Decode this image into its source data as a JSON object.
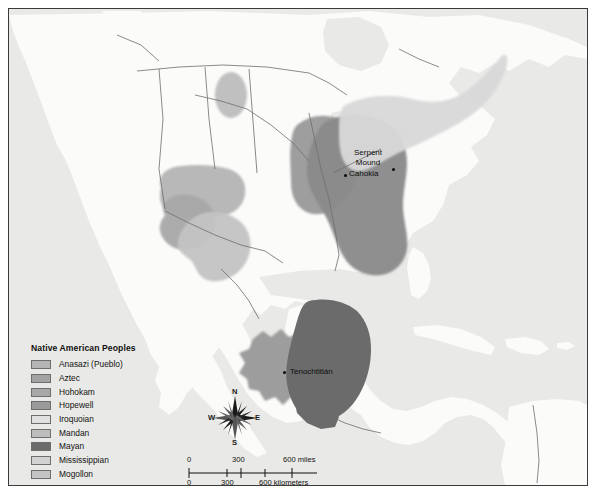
{
  "map": {
    "title": "Native American Peoples",
    "frame_color": "#3a3a3a",
    "ocean_color": "#e9e9e7",
    "land_color": "#fbfbfa",
    "border_color": "#6d6d6d"
  },
  "legend": {
    "title": "Native American Peoples",
    "items": [
      {
        "label": "Anasazi (Pueblo)",
        "color": "#b5b5b5"
      },
      {
        "label": "Aztec",
        "color": "#a3a3a3"
      },
      {
        "label": "Hohokam",
        "color": "#a8a8a8"
      },
      {
        "label": "Hopewell",
        "color": "#9a9a9a"
      },
      {
        "label": "Iroquoian",
        "color": "#e0e0e0"
      },
      {
        "label": "Mandan",
        "color": "#bdbdbd"
      },
      {
        "label": "Mayan",
        "color": "#6b6b6b"
      },
      {
        "label": "Mississippian",
        "color": "#d2d2d2"
      },
      {
        "label": "Mogollon",
        "color": "#c4c4c4"
      }
    ]
  },
  "compass": {
    "north": "N",
    "east": "E",
    "south": "S",
    "west": "W"
  },
  "scalebar": {
    "miles": {
      "t0": "0",
      "t1": "300",
      "t2": "600 miles"
    },
    "kilometers": {
      "t0": "0",
      "t1": "300",
      "t2": "600 kilometers"
    }
  },
  "places": [
    {
      "name": "Serpent Mound",
      "line1": "Serpent",
      "line2": "Mound"
    },
    {
      "name": "Cahokia",
      "line1": "Cahokia"
    },
    {
      "name": "Tenochtitlán",
      "line1": "Tenochtitlán"
    }
  ],
  "labels": {
    "serpent_line1": "Serpent",
    "serpent_line2": "Mound",
    "cahokia": "Cahokia",
    "tenochtitlan": "Tenochtitlán"
  }
}
